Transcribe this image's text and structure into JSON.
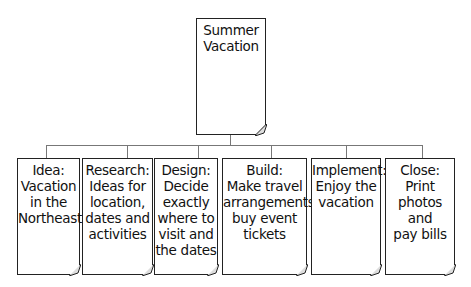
{
  "root": {
    "label": "Summer\nVacation"
  },
  "children": [
    {
      "label": "Idea:\nVacation\nin the\nNortheast"
    },
    {
      "label": "Research:\nIdeas for\nlocation,\ndates and\nactivities"
    },
    {
      "label": "Design:\nDecide\nexactly\nwhere to\nvisit and\nthe dates"
    },
    {
      "label": "Build:\nMake travel\narrangements,\nbuy event\ntickets"
    },
    {
      "label": "Implement:\nEnjoy the\nvacation"
    },
    {
      "label": "Close:\nPrint\nphotos and\npay bills"
    }
  ]
}
